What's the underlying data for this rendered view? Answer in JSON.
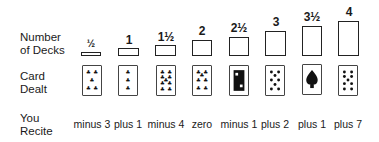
{
  "labels": {
    "decks": [
      "Number",
      "of Decks"
    ],
    "card": [
      "Card",
      "Dealt"
    ],
    "recite": [
      "You",
      "Recite"
    ]
  },
  "columns": [
    {
      "decks": "½",
      "card": "5 of clubs",
      "recite": "minus 3"
    },
    {
      "decks": "1",
      "card": "3 of clubs",
      "recite": "plus 1"
    },
    {
      "decks": "1½",
      "card": "9 of clubs",
      "recite": "minus 4"
    },
    {
      "decks": "2",
      "card": "7 of clubs",
      "recite": "zero"
    },
    {
      "decks": "2½",
      "card": "Jack of clubs",
      "recite": "minus 1"
    },
    {
      "decks": "3",
      "card": "8 of spades",
      "recite": "plus 2"
    },
    {
      "decks": "3½",
      "card": "Ace of spades",
      "recite": "plus 1"
    },
    {
      "decks": "4",
      "card": "10 of spades",
      "recite": "plus 7"
    }
  ]
}
